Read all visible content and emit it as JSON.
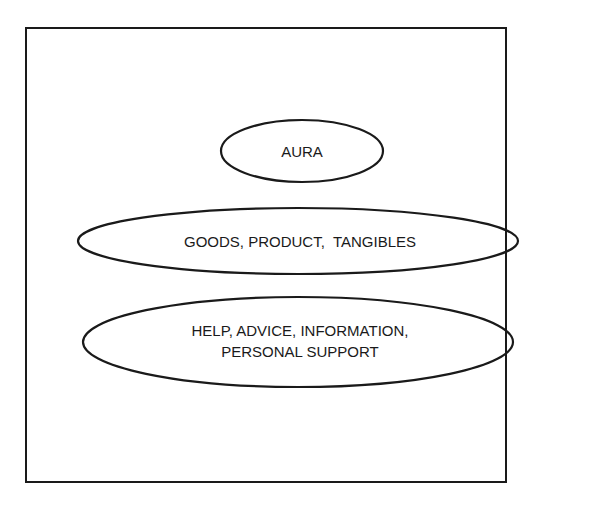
{
  "diagram": {
    "type": "layered-ellipses",
    "stroke_color": "#1a1a1a",
    "background_color": "#ffffff",
    "layers": [
      {
        "id": "aura",
        "lines": [
          "AURA"
        ]
      },
      {
        "id": "goods",
        "lines": [
          "GOODS, PRODUCT,  TANGIBLES"
        ]
      },
      {
        "id": "help",
        "lines": [
          "HELP, ADVICE, INFORMATION,",
          "PERSONAL SUPPORT"
        ]
      }
    ]
  }
}
